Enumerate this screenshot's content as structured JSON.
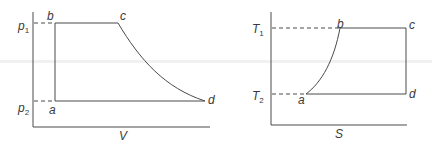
{
  "pv_diagram": {
    "x_axis_label": "V",
    "y_labels": [
      {
        "symbol": "p",
        "subscript": "1"
      },
      {
        "symbol": "p",
        "subscript": "2"
      }
    ],
    "points": {
      "a": "a",
      "b": "b",
      "c": "c",
      "d": "d"
    }
  },
  "ts_diagram": {
    "x_axis_label": "S",
    "y_labels": [
      {
        "symbol": "T",
        "subscript": "1"
      },
      {
        "symbol": "T",
        "subscript": "2"
      }
    ],
    "points": {
      "a": "a",
      "b": "b",
      "c": "c",
      "d": "d"
    }
  },
  "colors": {
    "line": "#4a4a4a",
    "text": "#3a3a3a",
    "background": "#ffffff"
  }
}
